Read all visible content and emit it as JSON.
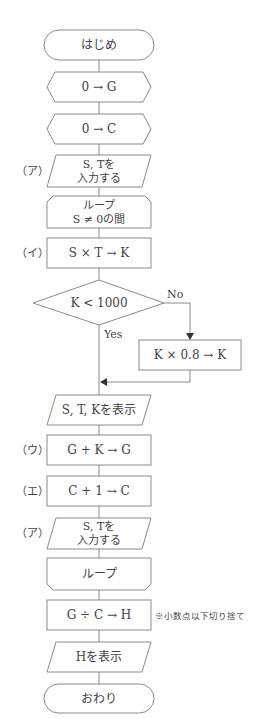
{
  "flowchart": {
    "start": "はじめ",
    "init_g": "0 → G",
    "init_c": "0 → C",
    "input1": {
      "label": "（ア）",
      "line1": "S, Tを",
      "line2": "入力する"
    },
    "loop_start": {
      "line1": "ループ",
      "line2": "S ≠ 0の間"
    },
    "calc_k": {
      "label": "（イ）",
      "text": "S × T → K"
    },
    "decision": {
      "text": "K < 1000",
      "no": "No",
      "yes": "Yes"
    },
    "discount": "K × 0.8 → K",
    "display_stk": "S, T, Kを表示",
    "sum_g": {
      "label": "（ウ）",
      "text": "G + K → G"
    },
    "count_c": {
      "label": "（エ）",
      "text": "C + 1 → C"
    },
    "input2": {
      "label": "（ア）",
      "line1": "S, Tを",
      "line2": "入力する"
    },
    "loop_end": "ループ",
    "avg_h": {
      "text": "G ÷ C → H",
      "note": "※小数点以下切り捨て"
    },
    "display_h": "Hを表示",
    "end": "おわり"
  },
  "colors": {
    "stroke": "#8a8a8a",
    "text": "#444444",
    "arrow": "#333333",
    "background": "#ffffff"
  }
}
